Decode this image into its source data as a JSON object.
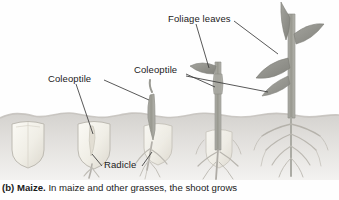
{
  "figure": {
    "panel_id": "(b)",
    "term": "Maize.",
    "caption_rest": " In maize and other grasses, the shoot grows",
    "soil_line_y": 115,
    "colors": {
      "sky": "#fefefe",
      "soil_top": "#d6d4d0",
      "soil_bottom": "#efeeec",
      "seed_fill": "#f2f0e9",
      "seed_edge": "#bdbab2",
      "shoot": "#9a9a95",
      "leaf": "#8f8f8a",
      "root": "#b3b0aa",
      "leader_line": "#3a3a3a",
      "label_text": "#1a1a1a"
    }
  },
  "labels": [
    {
      "id": "foliage",
      "text": "Foliage leaves",
      "name": "label-foliage-leaves"
    },
    {
      "id": "coleoptile_1",
      "text": "Coleoptile",
      "name": "label-coleoptile-left"
    },
    {
      "id": "coleoptile_2",
      "text": "Coleoptile",
      "name": "label-coleoptile-right"
    },
    {
      "id": "radicle",
      "text": "Radicle",
      "name": "label-radicle"
    }
  ],
  "stages": [
    {
      "index": 1,
      "name": "ungerminated-seed",
      "description": "Dormant maize grain buried below soil surface",
      "x_center": 28,
      "below_ground": true,
      "has_shoot": false,
      "has_roots": false
    },
    {
      "index": 2,
      "name": "radicle-emergence",
      "description": "Radicle emerges downward from the grain; coleoptile begins to form",
      "x_center": 95,
      "below_ground": true,
      "has_shoot": false,
      "has_roots": true
    },
    {
      "index": 3,
      "name": "coleoptile-breaks-surface",
      "description": "Coleoptile pushes up through the soil; seminal roots branching",
      "x_center": 155,
      "below_ground": false,
      "has_shoot": true,
      "has_roots": true
    },
    {
      "index": 4,
      "name": "first-foliage-leaf",
      "description": "First foliage leaf emerges through the coleoptile above soil",
      "x_center": 218,
      "below_ground": false,
      "has_shoot": true,
      "has_roots": true
    },
    {
      "index": 5,
      "name": "established-seedling",
      "description": "Established seedling with several foliage leaves and fibrous root system",
      "x_center": 292,
      "below_ground": false,
      "has_shoot": true,
      "has_roots": true
    }
  ]
}
